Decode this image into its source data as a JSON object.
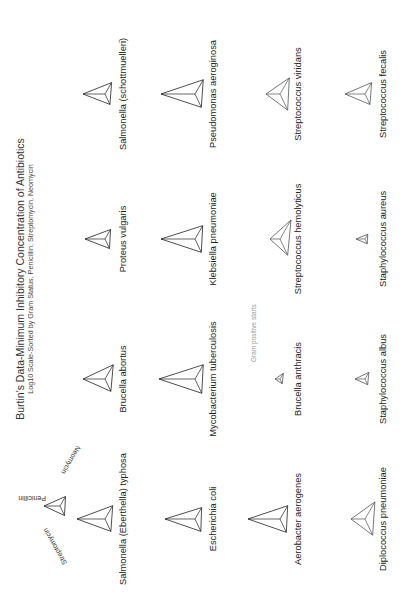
{
  "chart_data": {
    "type": "glyph-grid",
    "title": "Burtin's Data-Minimum Inhibitory Concentration of Antibiotics",
    "subtitle": "Log10 Scale-Sorted by Gram Status, Penicillin, Streptomycin, Neomycin",
    "orientation": "rotated 90 degrees counter-clockwise",
    "legend": {
      "axes": [
        "Penicillin",
        "Streptomycin",
        "Neomycin"
      ],
      "penicillin_direction": "up",
      "streptomycin_direction": "lower-left",
      "neomycin_direction": "lower-right"
    },
    "annotation": "Gram positive starts",
    "grid": {
      "rows": 4,
      "cols": 4
    },
    "bacteria": [
      {
        "name": "Salmonella (Eberthella) typhosa",
        "gram": "negative",
        "row": 0,
        "col": 0,
        "penicillin": 28,
        "streptomycin": 13,
        "neomycin": 14
      },
      {
        "name": "Brucella abortus",
        "gram": "negative",
        "row": 0,
        "col": 1,
        "penicillin": 22,
        "streptomycin": 13,
        "neomycin": 15
      },
      {
        "name": "Proteus vulgaris",
        "gram": "negative",
        "row": 0,
        "col": 2,
        "penicillin": 20,
        "streptomycin": 10,
        "neomycin": 10
      },
      {
        "name": "Salmonella (schottmuelleri)",
        "gram": "negative",
        "row": 0,
        "col": 3,
        "penicillin": 22,
        "streptomycin": 11,
        "neomycin": 12
      },
      {
        "name": "Escherichia coli",
        "gram": "negative",
        "row": 1,
        "col": 0,
        "penicillin": 30,
        "streptomycin": 13,
        "neomycin": 12
      },
      {
        "name": "Mycobacterium tuberculosis",
        "gram": "negative",
        "row": 1,
        "col": 1,
        "penicillin": 36,
        "streptomycin": 15,
        "neomycin": 15
      },
      {
        "name": "Klebsiella pneumoniae",
        "gram": "negative",
        "row": 1,
        "col": 2,
        "penicillin": 34,
        "streptomycin": 14,
        "neomycin": 14
      },
      {
        "name": "Pseudomonas aeroginosa",
        "gram": "negative",
        "row": 1,
        "col": 3,
        "penicillin": 34,
        "streptomycin": 14,
        "neomycin": 15
      },
      {
        "name": "Aerobacter aerogenes",
        "gram": "negative",
        "row": 2,
        "col": 0,
        "penicillin": 32,
        "streptomycin": 14,
        "neomycin": 14
      },
      {
        "name": "Brucella anthracis",
        "gram": "positive",
        "row": 2,
        "col": 1,
        "penicillin": 5,
        "streptomycin": 5,
        "neomycin": 6
      },
      {
        "name": "Streptococcus hemolyticus",
        "gram": "positive",
        "row": 2,
        "col": 2,
        "penicillin": 10,
        "streptomycin": 17,
        "neomycin": 20
      },
      {
        "name": "Streptococcus viridans",
        "gram": "positive",
        "row": 2,
        "col": 3,
        "penicillin": 14,
        "streptomycin": 17,
        "neomycin": 17
      },
      {
        "name": "Diplococcus pneumoniae",
        "gram": "positive",
        "row": 3,
        "col": 0,
        "penicillin": 14,
        "streptomycin": 17,
        "neomycin": 18
      },
      {
        "name": "Staphylococcus albus",
        "gram": "positive",
        "row": 3,
        "col": 1,
        "penicillin": 10,
        "streptomycin": 6,
        "neomycin": 7
      },
      {
        "name": "Staphylococcus aureus",
        "gram": "positive",
        "row": 3,
        "col": 2,
        "penicillin": 9,
        "streptomycin": 5,
        "neomycin": 5
      },
      {
        "name": "Streptococcus fecalis",
        "gram": "positive",
        "row": 3,
        "col": 3,
        "penicillin": 20,
        "streptomycin": 11,
        "neomycin": 12
      }
    ],
    "colors": {
      "glyph_stroke": "#222222",
      "gram_positive_stroke": "#555555",
      "note": "#999999"
    }
  }
}
